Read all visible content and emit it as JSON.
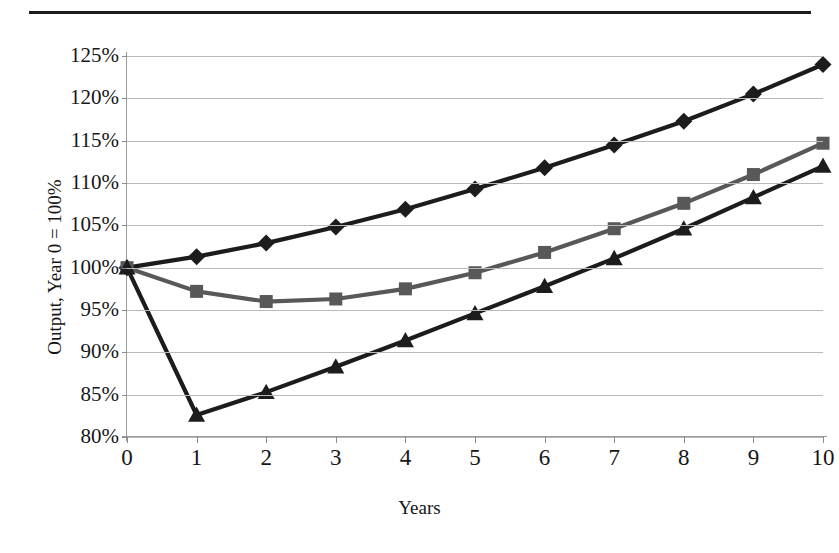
{
  "figure": {
    "title": "",
    "axis_title_x": "Years",
    "axis_title_y": "Output, Year 0 = 100%"
  },
  "chart_data": {
    "type": "line",
    "title": "",
    "xlabel": "Years",
    "ylabel": "Output, Year 0 = 100%",
    "x": [
      0,
      1,
      2,
      3,
      4,
      5,
      6,
      7,
      8,
      9,
      10
    ],
    "xticklabels": [
      "0",
      "1",
      "2",
      "3",
      "4",
      "5",
      "6",
      "7",
      "8",
      "9",
      "10"
    ],
    "yticklabels": [
      "80%",
      "85%",
      "90%",
      "95%",
      "100%",
      "105%",
      "110%",
      "115%",
      "120%",
      "125%"
    ],
    "yticks": [
      80,
      85,
      90,
      95,
      100,
      105,
      110,
      115,
      120,
      125
    ],
    "xlim": [
      0,
      10
    ],
    "ylim": [
      80,
      125
    ],
    "grid": "horizontal",
    "legend": "none",
    "series": [
      {
        "name": "series-diamond",
        "marker": "diamond",
        "color": "#1c1c1c",
        "values": [
          100.0,
          101.3,
          102.9,
          104.8,
          106.9,
          109.3,
          111.8,
          114.5,
          117.3,
          120.5,
          124.0
        ]
      },
      {
        "name": "series-square",
        "marker": "square",
        "color": "#585858",
        "values": [
          100.0,
          97.2,
          96.0,
          96.3,
          97.5,
          99.4,
          101.8,
          104.6,
          107.6,
          111.0,
          114.7
        ]
      },
      {
        "name": "series-triangle",
        "marker": "triangle",
        "color": "#1c1c1c",
        "values": [
          100.0,
          82.6,
          85.3,
          88.3,
          91.4,
          94.6,
          97.8,
          101.1,
          104.6,
          108.3,
          112.0
        ]
      }
    ]
  }
}
